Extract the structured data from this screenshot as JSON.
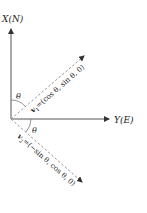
{
  "diagram": {
    "axes": {
      "x_axis_label": "X(N)",
      "y_axis_label": "Y(E)"
    },
    "angles": {
      "theta_top": "θ",
      "theta_bottom": "θ"
    },
    "vectors": {
      "v1": {
        "name": "v",
        "subscript": "1",
        "expression": "=(cos θ, sin θ, 0)"
      },
      "v2": {
        "name": "v",
        "subscript": "2",
        "expression": "=(−sin θ, cos θ, 0)"
      }
    },
    "colors": {
      "axis": "#555555",
      "vector": "#888888",
      "text": "#222222"
    }
  }
}
